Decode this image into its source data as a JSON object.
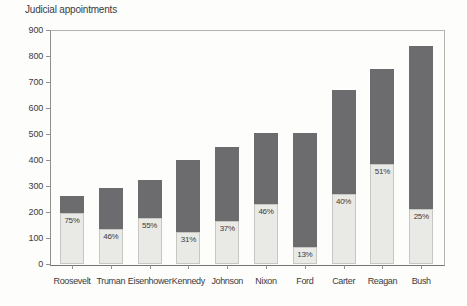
{
  "title": "Judicial appointments",
  "colors": {
    "bar_dark": "#6c6c6f",
    "bar_light": "#e9e9e6",
    "axis_line": "#8f8f8c",
    "frame_line": "#b3b3b0",
    "text": "#3b3b3b",
    "background": "#fdfdfb"
  },
  "chart_data": {
    "type": "bar",
    "stacked": true,
    "title": "Judicial appointments",
    "xlabel": "",
    "ylabel": "",
    "ylim": [
      0,
      900
    ],
    "yticks": [
      0,
      100,
      200,
      300,
      400,
      500,
      600,
      700,
      800,
      900
    ],
    "grid": false,
    "legend": "none",
    "categories": [
      "Roosevelt",
      "Truman",
      "Eisenhower",
      "Kennedy",
      "Johnson",
      "Nixon",
      "Ford",
      "Carter",
      "Reagan",
      "Bush"
    ],
    "series": [
      {
        "name": "light-lower-segment",
        "color": "#e9e9e6",
        "values": [
          195,
          134,
          177,
          124,
          167,
          232,
          66,
          268,
          383,
          210
        ]
      },
      {
        "name": "dark-upper-segment",
        "color": "#6c6c6f",
        "values": [
          65,
          158,
          145,
          276,
          283,
          273,
          439,
          402,
          367,
          630
        ]
      }
    ],
    "totals": [
      260,
      292,
      322,
      400,
      450,
      505,
      505,
      670,
      750,
      840
    ],
    "bar_labels": [
      "75%",
      "46%",
      "55%",
      "31%",
      "37%",
      "46%",
      "13%",
      "40%",
      "51%",
      "25%"
    ]
  }
}
